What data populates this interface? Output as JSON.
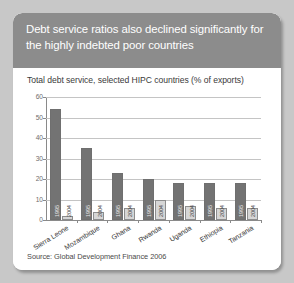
{
  "header": {
    "title": "Debt service ratios also declined significantly for the highly indebted poor countries"
  },
  "chart_data": {
    "type": "bar",
    "title": "Total debt service, selected HIPC countries (% of exports)",
    "subtitle": "",
    "xlabel": "",
    "ylabel": "",
    "ylim": [
      0,
      60
    ],
    "yticks": [
      0,
      10,
      20,
      30,
      40,
      50,
      60
    ],
    "grid": true,
    "legend_position": "none",
    "categories": [
      "Sierra Leone",
      "Mozambique",
      "Ghana",
      "Rwanda",
      "Uganda",
      "Ethiopia",
      "Tanzania"
    ],
    "series": [
      {
        "name": "1995",
        "color": "#737373",
        "values": [
          54,
          35,
          23,
          20,
          18,
          18,
          18
        ]
      },
      {
        "name": "2004",
        "color": "#d6d6d6",
        "values": [
          2,
          4,
          6,
          10,
          7,
          6,
          6
        ]
      }
    ],
    "bar_labels": {
      "series_1": [
        "1995",
        "1995",
        "1995",
        "1995",
        "1995",
        "1995",
        "1995"
      ],
      "series_2": [
        "2004",
        "2004",
        "2004",
        "2004",
        "2004",
        "2004",
        "2004"
      ]
    }
  },
  "source": {
    "text": "Source: Global Development Finance 2006"
  },
  "colors": {
    "page_background": "#c8c8c8",
    "header_background": "#8c8c8c",
    "panel_background": "#ffffff",
    "bar_1995": "#737373",
    "bar_2004": "#d6d6d6",
    "gridline": "#c4c4c4",
    "axis": "#8a8a8a"
  }
}
